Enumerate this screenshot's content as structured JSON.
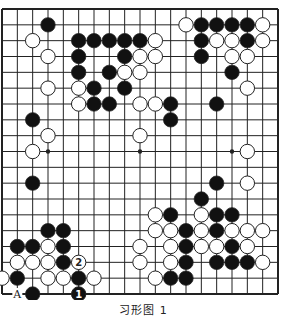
{
  "diagram": {
    "type": "go-board",
    "size": 19,
    "caption": "习形图 1",
    "colors": {
      "background": "#ffffff",
      "line": "#222222",
      "black_stone": "#111111",
      "white_stone": "#ffffff",
      "stone_outline": "#222222"
    },
    "star_points": [
      [
        3,
        9
      ],
      [
        9,
        9
      ],
      [
        15,
        9
      ]
    ],
    "black_stones": [
      [
        3,
        1
      ],
      [
        5,
        2
      ],
      [
        6,
        2
      ],
      [
        7,
        2
      ],
      [
        8,
        2
      ],
      [
        9,
        2
      ],
      [
        5,
        3
      ],
      [
        8,
        3
      ],
      [
        5,
        4
      ],
      [
        7,
        4
      ],
      [
        6,
        5
      ],
      [
        8,
        5
      ],
      [
        6,
        6
      ],
      [
        7,
        6
      ],
      [
        11,
        6
      ],
      [
        11,
        7
      ],
      [
        13,
        1
      ],
      [
        14,
        1
      ],
      [
        15,
        1
      ],
      [
        16,
        1
      ],
      [
        13,
        2
      ],
      [
        16,
        2
      ],
      [
        13,
        3
      ],
      [
        15,
        4
      ],
      [
        14,
        6
      ],
      [
        2,
        7
      ],
      [
        2,
        11
      ],
      [
        14,
        11
      ],
      [
        13,
        12
      ],
      [
        3,
        14
      ],
      [
        4,
        14
      ],
      [
        1,
        15
      ],
      [
        2,
        15
      ],
      [
        4,
        15
      ],
      [
        4,
        16
      ],
      [
        1,
        17
      ],
      [
        5,
        17
      ],
      [
        2,
        18
      ],
      [
        11,
        13
      ],
      [
        14,
        13
      ],
      [
        15,
        13
      ],
      [
        12,
        14
      ],
      [
        14,
        14
      ],
      [
        12,
        15
      ],
      [
        15,
        15
      ],
      [
        12,
        16
      ],
      [
        14,
        16
      ],
      [
        15,
        16
      ],
      [
        16,
        16
      ],
      [
        11,
        17
      ],
      [
        12,
        17
      ]
    ],
    "white_stones": [
      [
        2,
        2
      ],
      [
        3,
        3
      ],
      [
        3,
        5
      ],
      [
        5,
        5
      ],
      [
        5,
        6
      ],
      [
        10,
        2
      ],
      [
        9,
        3
      ],
      [
        10,
        3
      ],
      [
        8,
        4
      ],
      [
        9,
        4
      ],
      [
        9,
        6
      ],
      [
        10,
        6
      ],
      [
        12,
        1
      ],
      [
        17,
        1
      ],
      [
        14,
        2
      ],
      [
        15,
        2
      ],
      [
        17,
        2
      ],
      [
        15,
        3
      ],
      [
        16,
        3
      ],
      [
        16,
        5
      ],
      [
        3,
        8
      ],
      [
        9,
        8
      ],
      [
        2,
        9
      ],
      [
        16,
        9
      ],
      [
        16,
        11
      ],
      [
        3,
        15
      ],
      [
        1,
        16
      ],
      [
        2,
        16
      ],
      [
        3,
        16
      ],
      [
        0,
        17
      ],
      [
        3,
        17
      ],
      [
        4,
        17
      ],
      [
        6,
        17
      ],
      [
        10,
        13
      ],
      [
        13,
        13
      ],
      [
        10,
        14
      ],
      [
        11,
        14
      ],
      [
        13,
        14
      ],
      [
        15,
        14
      ],
      [
        16,
        14
      ],
      [
        17,
        14
      ],
      [
        9,
        15
      ],
      [
        11,
        15
      ],
      [
        13,
        15
      ],
      [
        14,
        15
      ],
      [
        16,
        15
      ],
      [
        9,
        16
      ],
      [
        11,
        16
      ],
      [
        17,
        16
      ],
      [
        10,
        17
      ]
    ],
    "numbered_stones": [
      {
        "col": 5,
        "row": 18,
        "color": "black",
        "number": "1"
      },
      {
        "col": 5,
        "row": 16,
        "color": "white",
        "number": "2"
      }
    ],
    "labels": [
      {
        "col": 1,
        "row": 18,
        "text": "A"
      }
    ]
  }
}
